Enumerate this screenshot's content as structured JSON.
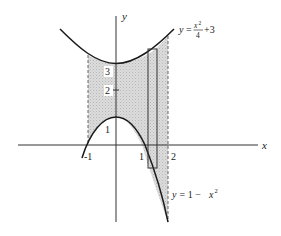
{
  "figure": {
    "type": "area-between-curves",
    "axes": {
      "x_label": "x",
      "y_label": "y",
      "x_ticks": [
        "-1",
        "1",
        "2"
      ],
      "y_ticks": [
        "1",
        "2",
        "3"
      ]
    },
    "curves": {
      "upper": {
        "label_prefix": "y",
        "label_eq": "=",
        "label_num": "x",
        "label_num_exp": "2",
        "label_den": "4",
        "label_suffix": "+3",
        "expression": "y = x^2/4 + 3"
      },
      "lower": {
        "label": "y = 1 − x²",
        "label_prefix": "y",
        "label_mid": " = 1 − ",
        "label_var": "x",
        "label_exp": "2",
        "expression": "y = 1 - x^2"
      }
    },
    "shaded_region": {
      "x_from": -1,
      "x_to": 2,
      "fill": "#d2d2d2"
    },
    "representative_rectangle": {
      "x_center": 1.4,
      "stroke": "#333333"
    },
    "colors": {
      "curve": "#1a1a1a",
      "axis": "#333333",
      "dashed": "#555555",
      "shade": "#d4d4d4"
    }
  }
}
